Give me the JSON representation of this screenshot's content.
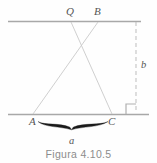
{
  "figure": {
    "caption": "Figura  4.10.5",
    "background_color": "#fefefe",
    "line_color": "#a8a8a8",
    "thin_line_color": "#c9c9c9",
    "brace_color": "#1a1a1a",
    "label_color": "#555555",
    "caption_color": "#8c8c8c",
    "width": 157,
    "height": 163
  },
  "labels": {
    "vertex_q": "Q",
    "vertex_b": "B",
    "vertex_a": "A",
    "vertex_c": "C",
    "side_a": "a",
    "side_b": "b"
  },
  "geometry": {
    "top_line": {
      "x1": 8,
      "y1": 21,
      "x2": 141,
      "y2": 21
    },
    "bottom_line": {
      "x1": 8,
      "y1": 114,
      "x2": 149,
      "y2": 114
    },
    "segment_q_to_c": {
      "x1": 71,
      "y1": 22,
      "x2": 112,
      "y2": 114
    },
    "segment_b_to_a": {
      "x1": 98,
      "y1": 22,
      "x2": 33,
      "y2": 114
    },
    "dashed_height_line": {
      "x1": 136,
      "y1": 22,
      "x2": 136,
      "y2": 113
    },
    "right_angle_marker": {
      "x": 126,
      "y": 104,
      "size": 10
    },
    "brace": {
      "x_left": 38,
      "x_right": 108,
      "y": 123
    }
  }
}
